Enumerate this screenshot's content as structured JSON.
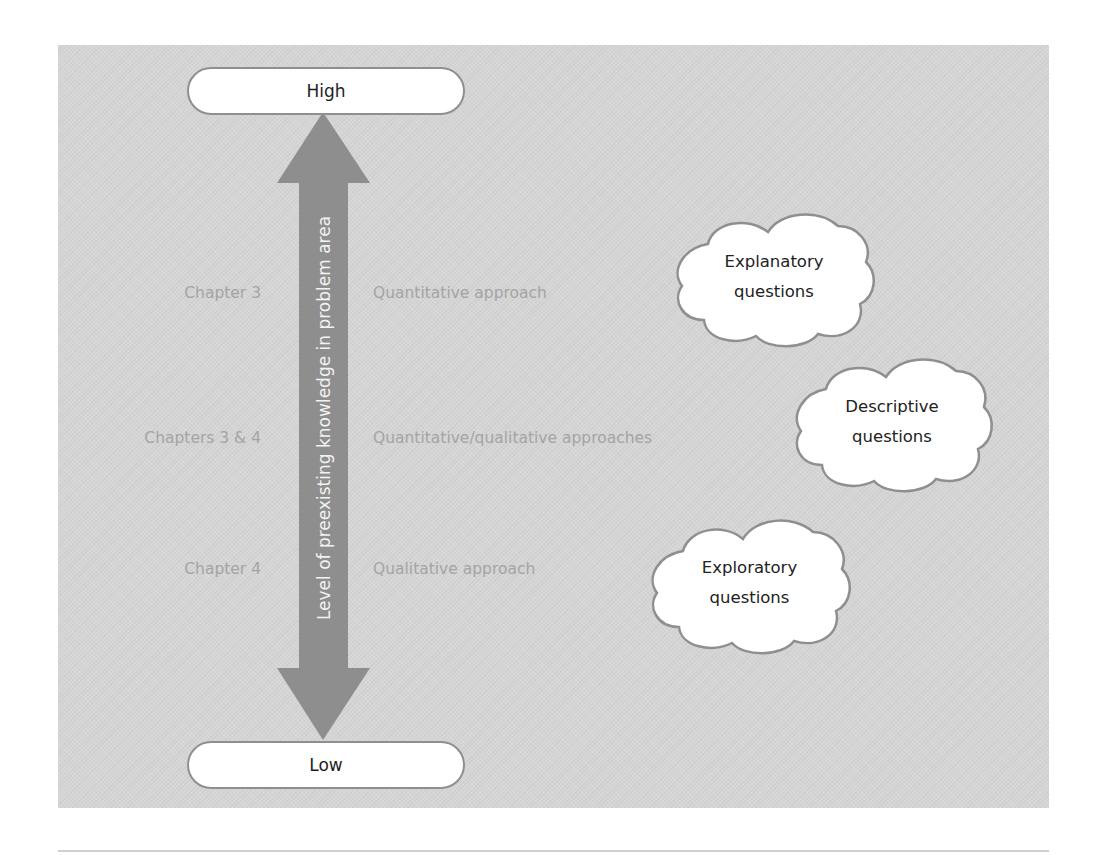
{
  "diagram": {
    "scale": {
      "top_label": "High",
      "bottom_label": "Low",
      "axis_title": "Level of preexisting knowledge in problem area"
    },
    "rows": [
      {
        "chapter": "Chapter 3",
        "approach": "Quantitative approach",
        "question_line1": "Explanatory",
        "question_line2": "questions"
      },
      {
        "chapter": "Chapters 3 & 4",
        "approach": "Quantitative/qualitative approaches",
        "question_line1": "Descriptive",
        "question_line2": "questions"
      },
      {
        "chapter": "Chapter 4",
        "approach": "Qualitative approach",
        "question_line1": "Exploratory",
        "question_line2": "questions"
      }
    ],
    "colors": {
      "panel": "#d5d5d5",
      "arrow": "#8e8e8e",
      "muted_text": "#a4a4a4",
      "pill_border": "#8f8f8f"
    }
  }
}
